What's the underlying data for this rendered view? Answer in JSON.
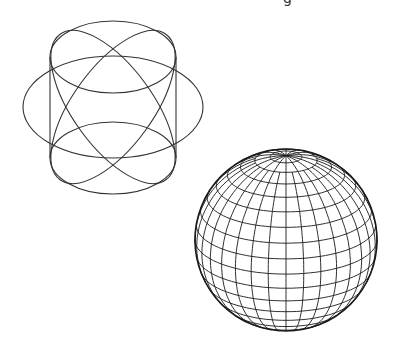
{
  "caption_fragment": "g",
  "colors": {
    "background": "#ffffff",
    "line": "#333333",
    "mesh_line": "#1a1a1a"
  },
  "figures": [
    {
      "name": "sphere-inscribed-in-cylinder-wireframe",
      "top_ellipse": {
        "cx": 113,
        "cy": 57,
        "rx": 63,
        "ry": 36
      },
      "bottom_ellipse": {
        "cx": 113,
        "cy": 158,
        "rx": 63,
        "ry": 36
      },
      "equator_ellipse": {
        "cx": 113,
        "cy": 107,
        "rx": 90,
        "ry": 51
      },
      "walls": {
        "left_x": 50,
        "right_x": 176,
        "top_y": 57,
        "bottom_y": 158
      },
      "meridians": [
        {
          "cx": 113,
          "cy": 107,
          "rx": 40,
          "ry": 90,
          "rotate": 36
        },
        {
          "cx": 113,
          "cy": 107,
          "rx": 40,
          "ry": 90,
          "rotate": -36
        }
      ]
    },
    {
      "name": "tessellated-sphere-mesh",
      "cx": 286,
      "cy": 240,
      "r": 91,
      "tilt_deg": 22,
      "latitude_bands": 18,
      "longitude_segments": 32
    }
  ]
}
